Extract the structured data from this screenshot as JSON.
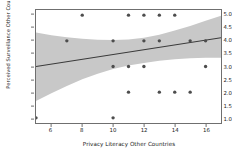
{
  "chart_data": {
    "type": "scatter",
    "title": "",
    "xlabel": "Privacy Literacy Other Countries",
    "ylabel": "Perceived Surveillance Other Countries",
    "xlim": [
      5,
      17
    ],
    "ylim": [
      0.8,
      5.2
    ],
    "xticks": [
      6,
      8,
      10,
      12,
      14,
      16
    ],
    "xtick_labels": [
      "6",
      "8",
      "10",
      "12",
      "14",
      "16"
    ],
    "yticks": [
      1.0,
      1.5,
      2.0,
      2.5,
      3.0,
      3.5,
      4.0,
      4.5,
      5.0
    ],
    "ytick_labels": [
      "1.0",
      "1.5",
      "2.0",
      "2.5",
      "3.0",
      "3.5",
      "4.0",
      "4.5",
      "5.0"
    ],
    "grid": false,
    "legend": null,
    "marker_color": "#4d4d4d",
    "line_color": "#3a3a3a",
    "band_color": "#c8c8c8",
    "points": [
      {
        "x": 5,
        "y": 1.0
      },
      {
        "x": 10,
        "y": 1.0
      },
      {
        "x": 11,
        "y": 2.0
      },
      {
        "x": 13,
        "y": 2.0
      },
      {
        "x": 14,
        "y": 2.0
      },
      {
        "x": 15,
        "y": 2.0
      },
      {
        "x": 10,
        "y": 3.0
      },
      {
        "x": 11,
        "y": 3.0
      },
      {
        "x": 12,
        "y": 3.0
      },
      {
        "x": 16,
        "y": 3.0
      },
      {
        "x": 7,
        "y": 4.0
      },
      {
        "x": 10,
        "y": 4.0
      },
      {
        "x": 12,
        "y": 4.0
      },
      {
        "x": 13,
        "y": 4.0
      },
      {
        "x": 15,
        "y": 4.0
      },
      {
        "x": 16,
        "y": 4.0
      },
      {
        "x": 8,
        "y": 5.0
      },
      {
        "x": 11,
        "y": 5.0
      },
      {
        "x": 12,
        "y": 5.0
      },
      {
        "x": 13,
        "y": 5.0
      },
      {
        "x": 14,
        "y": 5.0
      }
    ],
    "regression_line": {
      "x_start": 5,
      "y_start": 3.0,
      "x_end": 17,
      "y_end": 4.12
    },
    "confidence_band": {
      "upper": [
        {
          "x": 5,
          "y": 4.32
        },
        {
          "x": 6,
          "y": 4.22
        },
        {
          "x": 7,
          "y": 4.14
        },
        {
          "x": 8,
          "y": 4.08
        },
        {
          "x": 9,
          "y": 4.04
        },
        {
          "x": 10,
          "y": 4.03
        },
        {
          "x": 11,
          "y": 4.05
        },
        {
          "x": 12,
          "y": 4.12
        },
        {
          "x": 13,
          "y": 4.24
        },
        {
          "x": 14,
          "y": 4.4
        },
        {
          "x": 15,
          "y": 4.58
        },
        {
          "x": 16,
          "y": 4.78
        },
        {
          "x": 17,
          "y": 4.98
        }
      ],
      "lower": [
        {
          "x": 5,
          "y": 1.66
        },
        {
          "x": 6,
          "y": 1.96
        },
        {
          "x": 7,
          "y": 2.24
        },
        {
          "x": 8,
          "y": 2.5
        },
        {
          "x": 9,
          "y": 2.72
        },
        {
          "x": 10,
          "y": 2.9
        },
        {
          "x": 11,
          "y": 3.04
        },
        {
          "x": 12,
          "y": 3.14
        },
        {
          "x": 13,
          "y": 3.22
        },
        {
          "x": 14,
          "y": 3.28
        },
        {
          "x": 15,
          "y": 3.32
        },
        {
          "x": 16,
          "y": 3.34
        },
        {
          "x": 17,
          "y": 3.34
        }
      ]
    }
  }
}
